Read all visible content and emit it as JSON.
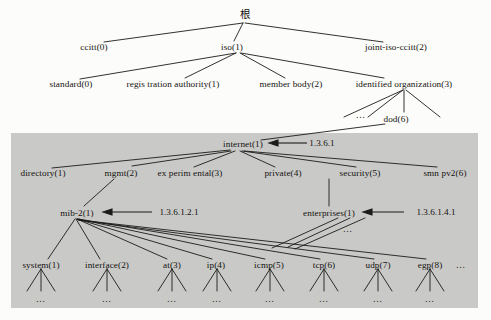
{
  "figure": {
    "background_color": "#fcfcfa",
    "highlight_band_color": "#c9c9c7",
    "line_color": "#1b1b19",
    "text_color": "#14120f"
  },
  "nodes": {
    "root": {
      "label": "根",
      "x": 245,
      "y": 8
    },
    "ccitt": {
      "label": "ccitt(0)",
      "x": 94,
      "y": 45
    },
    "iso": {
      "label": "iso(1)",
      "x": 232,
      "y": 45
    },
    "joint": {
      "label": "joint-iso-ccitt(2)",
      "x": 396,
      "y": 45
    },
    "standard": {
      "label": "standard(0)",
      "x": 71,
      "y": 83
    },
    "regis": {
      "label": "regis tration authority(1)",
      "x": 173,
      "y": 83
    },
    "member": {
      "label": "member body(2)",
      "x": 291,
      "y": 83
    },
    "identified": {
      "label": "identified organization(3)",
      "x": 404,
      "y": 83
    },
    "dod": {
      "label": "dod(6)",
      "x": 396,
      "y": 118
    },
    "internet": {
      "label": "internet(1)",
      "x": 243,
      "y": 143
    },
    "directory": {
      "label": "directory(1)",
      "x": 43,
      "y": 172
    },
    "mgmt": {
      "label": "mgmt(2)",
      "x": 121,
      "y": 172
    },
    "experimental": {
      "label": "ex perim ental(3)",
      "x": 190,
      "y": 172
    },
    "private": {
      "label": "private(4)",
      "x": 283,
      "y": 172
    },
    "security": {
      "label": "security(5)",
      "x": 360,
      "y": 172
    },
    "snmpv2": {
      "label": "smn pv2(6)",
      "x": 445,
      "y": 172
    },
    "mib2": {
      "label": "mib-2(1)",
      "x": 77,
      "y": 212
    },
    "enterprises": {
      "label": "enterprises(1)",
      "x": 329,
      "y": 212
    },
    "system": {
      "label": "system(1)",
      "x": 41,
      "y": 264
    },
    "interface": {
      "label": "interface(2)",
      "x": 107,
      "y": 264
    },
    "at": {
      "label": "at(3)",
      "x": 172,
      "y": 264
    },
    "ip": {
      "label": "ip(4)",
      "x": 216,
      "y": 264
    },
    "icmp": {
      "label": "icmp(5)",
      "x": 269,
      "y": 264
    },
    "tcp": {
      "label": "tcp(6)",
      "x": 324,
      "y": 264
    },
    "udp": {
      "label": "udp(7)",
      "x": 378,
      "y": 264
    },
    "egp": {
      "label": "egp(8)",
      "x": 430,
      "y": 264
    }
  },
  "oid_annotations": [
    {
      "name": "internet-oid",
      "text": "1.3.6.1",
      "x": 322,
      "y": 137
    },
    {
      "name": "mib2-oid",
      "text": "1.3.6.1.2.1",
      "x": 179,
      "y": 206
    },
    {
      "name": "enterprises-oid",
      "text": "1.3.6.1.4.1",
      "x": 436,
      "y": 206
    }
  ],
  "ellipses": [
    {
      "name": "ellipsis-dod-siblings",
      "text": "…",
      "x": 361,
      "y": 113
    },
    {
      "name": "ellipsis-egp-trailing",
      "text": "…",
      "x": 461,
      "y": 263
    },
    {
      "name": "ellipsis-enterprises-children",
      "text": "…",
      "x": 348,
      "y": 228
    },
    {
      "name": "ellipsis-leaf-system",
      "text": "…",
      "x": 41,
      "y": 299
    },
    {
      "name": "ellipsis-leaf-interface",
      "text": "…",
      "x": 107,
      "y": 299
    },
    {
      "name": "ellipsis-leaf-at",
      "text": "…",
      "x": 172,
      "y": 299
    },
    {
      "name": "ellipsis-leaf-ip",
      "text": "…",
      "x": 217,
      "y": 299
    },
    {
      "name": "ellipsis-leaf-icmp",
      "text": "…",
      "x": 270,
      "y": 299
    },
    {
      "name": "ellipsis-leaf-tcp",
      "text": "…",
      "x": 324,
      "y": 299
    },
    {
      "name": "ellipsis-leaf-udp",
      "text": "…",
      "x": 378,
      "y": 299
    },
    {
      "name": "ellipsis-leaf-egp",
      "text": "…",
      "x": 430,
      "y": 299
    }
  ],
  "highlight_band": {
    "x": 11,
    "y": 133,
    "width": 467,
    "height": 175
  }
}
